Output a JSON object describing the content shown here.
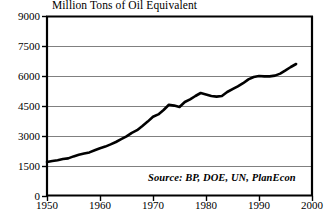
{
  "chart_data": {
    "type": "line",
    "title": "Million Tons of Oil Equivalent",
    "xlabel": "",
    "ylabel": "",
    "xlim": [
      1950,
      2000
    ],
    "ylim": [
      0,
      9000
    ],
    "grid": true,
    "legend": false,
    "annotation": "Source: BP, DOE, UN, PlanEcon",
    "ytick_labels": [
      "9000",
      "7500",
      "6000",
      "4500",
      "3000",
      "1500",
      "0"
    ],
    "ytick_values": [
      9000,
      7500,
      6000,
      4500,
      3000,
      1500,
      0
    ],
    "xtick_labels": [
      "1950",
      "1960",
      "1970",
      "1980",
      "1990",
      "2000"
    ],
    "xtick_values": [
      1950,
      1960,
      1970,
      1980,
      1990,
      2000
    ],
    "line_color": "#000000",
    "grid_color": "#808080",
    "axis_color": "#000000",
    "series": [
      {
        "name": "World Energy Use",
        "x": [
          1950,
          1951,
          1952,
          1953,
          1954,
          1955,
          1956,
          1957,
          1958,
          1959,
          1960,
          1961,
          1962,
          1963,
          1964,
          1965,
          1966,
          1967,
          1968,
          1969,
          1970,
          1971,
          1972,
          1973,
          1974,
          1975,
          1976,
          1977,
          1978,
          1979,
          1980,
          1981,
          1982,
          1983,
          1984,
          1985,
          1986,
          1987,
          1988,
          1989,
          1990,
          1991,
          1992,
          1993,
          1994,
          1995,
          1996,
          1997
        ],
        "values": [
          1700,
          1750,
          1790,
          1850,
          1880,
          1980,
          2060,
          2120,
          2180,
          2290,
          2390,
          2470,
          2580,
          2700,
          2840,
          2980,
          3160,
          3290,
          3500,
          3720,
          3960,
          4080,
          4300,
          4560,
          4520,
          4450,
          4700,
          4830,
          5000,
          5150,
          5080,
          5000,
          4970,
          5000,
          5200,
          5340,
          5480,
          5640,
          5830,
          5950,
          6000,
          5980,
          5980,
          6020,
          6120,
          6280,
          6450,
          6600
        ]
      }
    ]
  }
}
